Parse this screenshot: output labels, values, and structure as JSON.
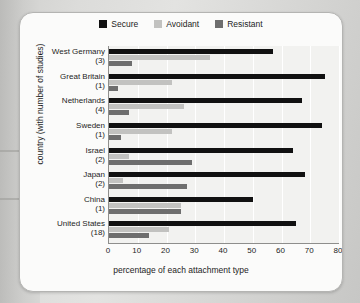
{
  "chart_data": {
    "type": "bar",
    "orientation": "horizontal",
    "title": "",
    "xlabel": "percentage of each attachment type",
    "ylabel": "country (with number of studies)",
    "xlim": [
      0,
      80
    ],
    "xticks": [
      0,
      10,
      20,
      30,
      40,
      50,
      60,
      70,
      80
    ],
    "grid": true,
    "legend_position": "top-center",
    "categories": [
      "West Germany",
      "Great Britain",
      "Netherlands",
      "Sweden",
      "Israel",
      "Japan",
      "China",
      "United States"
    ],
    "category_counts": [
      "(3)",
      "(1)",
      "(4)",
      "(1)",
      "(2)",
      "(2)",
      "(1)",
      "(18)"
    ],
    "series": [
      {
        "name": "Secure",
        "color": "#111111",
        "values": [
          57,
          75,
          67,
          74,
          64,
          68,
          50,
          65
        ]
      },
      {
        "name": "Avoidant",
        "color": "#c2c2c0",
        "values": [
          35,
          22,
          26,
          22,
          7,
          5,
          25,
          21
        ]
      },
      {
        "name": "Resistant",
        "color": "#6e6e6e",
        "values": [
          8,
          3,
          7,
          4,
          29,
          27,
          25,
          14
        ]
      }
    ]
  },
  "legend": {
    "items": [
      {
        "label": "Secure",
        "color": "#111111",
        "swatch": "legend-swatch-secure"
      },
      {
        "label": "Avoidant",
        "color": "#c2c2c0",
        "swatch": "legend-swatch-avoidant"
      },
      {
        "label": "Resistant",
        "color": "#6e6e6e",
        "swatch": "legend-swatch-resistant"
      }
    ]
  },
  "axes": {
    "x_title": "percentage of each attachment type",
    "y_title": "country (with number of studies)",
    "x_tick_labels": [
      "0",
      "10",
      "20",
      "30",
      "40",
      "50",
      "60",
      "70",
      "80"
    ]
  }
}
